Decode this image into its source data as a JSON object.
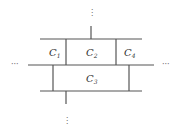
{
  "diagram": {
    "cells": [
      {
        "id": "C1",
        "base": "C",
        "sub": "1",
        "x": 50,
        "y": 56
      },
      {
        "id": "C2",
        "base": "C",
        "sub": "2",
        "x": 87,
        "y": 56
      },
      {
        "id": "C4",
        "base": "C",
        "sub": "4",
        "x": 124,
        "y": 56
      },
      {
        "id": "C3",
        "base": "C",
        "sub": "3",
        "x": 87,
        "y": 82
      }
    ],
    "ellipsis_horizontal": "···",
    "ellipsis_vertical": "⋮",
    "colors": {
      "line": "#555555",
      "text": "#333333"
    }
  }
}
